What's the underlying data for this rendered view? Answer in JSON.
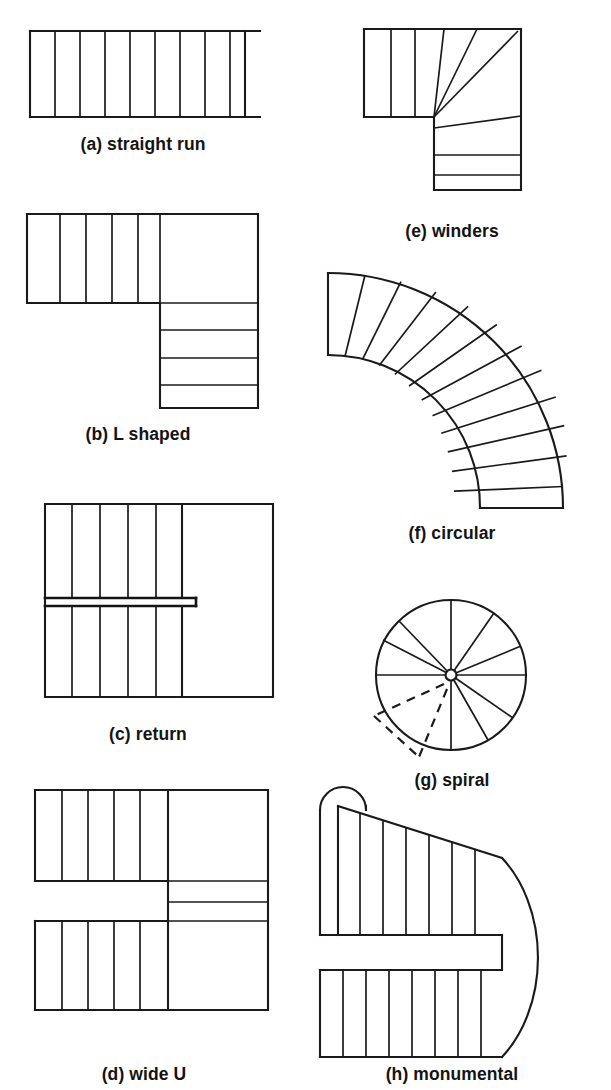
{
  "figure": {
    "width": 611,
    "height": 1090,
    "background_color": "#ffffff",
    "line_color": "#1a1a1a"
  },
  "diagrams": [
    {
      "key": "straight_run",
      "letter": "(a)",
      "name": "straight run",
      "caption": "(a) straight run",
      "caption_x": 143,
      "caption_y": 150,
      "tread_count": 10,
      "description": "single straight flight of parallel treads between two stringers"
    },
    {
      "key": "l_shaped",
      "letter": "(b)",
      "name": "L shaped",
      "caption": "(b) L shaped",
      "caption_x": 138,
      "caption_y": 440,
      "tread_count": 8,
      "landing_count": 1,
      "description": "upper flight, square landing, then flight turning 90 degrees downward"
    },
    {
      "key": "return",
      "letter": "(c)",
      "name": "return",
      "caption": "(c) return",
      "caption_x": 148,
      "caption_y": 740,
      "tread_count": 12,
      "description": "two parallel flights separated by a narrow stair well"
    },
    {
      "key": "wide_u",
      "letter": "(d)",
      "name": "wide U",
      "caption": "(d) wide U",
      "caption_x": 144,
      "caption_y": 1080,
      "tread_count": 13,
      "description": "two wide parallel flights joined by winding steps on the right"
    },
    {
      "key": "winders",
      "letter": "(e)",
      "name": "winders",
      "caption": "(e) winders",
      "caption_x": 452,
      "caption_y": 237,
      "tread_count": 9,
      "winder_count": 4,
      "description": "straight treads turning a corner with wedge shaped winder treads"
    },
    {
      "key": "circular",
      "letter": "(f)",
      "name": "circular",
      "caption": "(f) circular",
      "caption_x": 452,
      "caption_y": 539,
      "tread_count": 13,
      "description": "curved flight of radial treads following a quarter circle arc"
    },
    {
      "key": "spiral",
      "letter": "(g)",
      "name": "spiral",
      "caption": "(g) spiral",
      "caption_x": 452,
      "caption_y": 786,
      "tread_count": 11,
      "dashed_tread_count": 2,
      "description": "circular plan with treads radiating from a central newel post"
    },
    {
      "key": "monumental",
      "letter": "(h)",
      "name": "monumental",
      "caption": "(h) monumental",
      "caption_x": 452,
      "caption_y": 1080,
      "tread_count": 17,
      "description": "wide ceremonial stair with rounded end and flaring treads"
    }
  ]
}
